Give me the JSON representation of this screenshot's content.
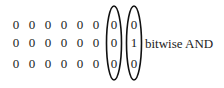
{
  "diagram": {
    "label": "bitwise AND",
    "rows": [
      [
        "0",
        "0",
        "0",
        "0",
        "0",
        "0",
        "0",
        "0"
      ],
      [
        "0",
        "0",
        "0",
        "0",
        "0",
        "0",
        "0",
        "1"
      ],
      [
        "0",
        "0",
        "0",
        "0",
        "0",
        "0",
        "0",
        "0"
      ]
    ],
    "circled_columns": [
      6,
      7
    ]
  }
}
